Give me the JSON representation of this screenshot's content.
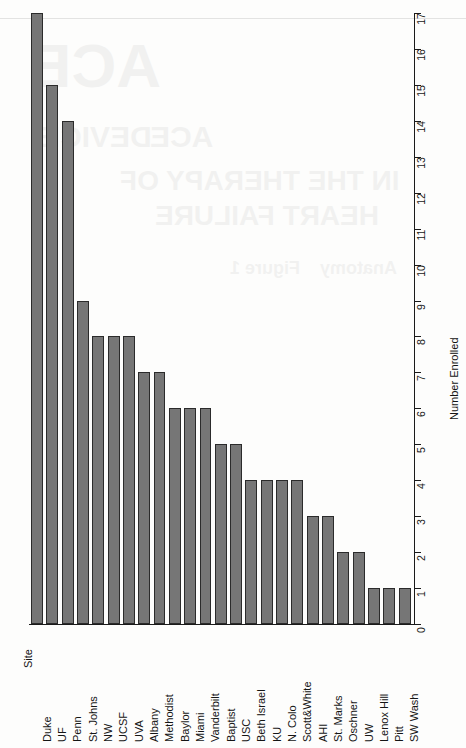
{
  "chart_data": {
    "type": "bar",
    "orientation": "vertical-bars-rotated-page",
    "title": "",
    "xlabel": "Site",
    "ylabel": "Number Enrolled",
    "ylim": [
      0,
      17
    ],
    "grid": false,
    "legend": null,
    "tick_labels": [
      "0",
      "1",
      "2",
      "3",
      "4",
      "5",
      "6",
      "7",
      "8",
      "9",
      "10",
      "11",
      "12",
      "13",
      "14",
      "15",
      "16",
      "17"
    ],
    "categories": [
      "Duke",
      "UF",
      "Penn",
      "St. Johns",
      "NW",
      "UCSF",
      "UVA",
      "Albany",
      "Methodist",
      "Baylor",
      "Miami",
      "Vanderbilt",
      "Baptist",
      "USC",
      "Beth Israel",
      "KU",
      "N. Colo",
      "Scott&White",
      "AHI",
      "St. Marks",
      "Oschner",
      "UW",
      "Lenox Hill",
      "Pitt",
      "SW Wash"
    ],
    "values": [
      17,
      15,
      14,
      9,
      8,
      8,
      8,
      7,
      7,
      6,
      6,
      6,
      5,
      5,
      4,
      4,
      4,
      4,
      3,
      3,
      2,
      2,
      1,
      1,
      1
    ]
  },
  "style": {
    "bar_fill": "#767676",
    "bar_border": "#2b2b2b",
    "axis_color": "#1a1a1a",
    "page_background": "#fdfdfc"
  },
  "bleed_through_text": [
    "DEVICE",
    "ACE",
    "IN THE THERAPY OF",
    "HEART FAILURE",
    "Figure 1",
    "Anatomy",
    "Table"
  ]
}
